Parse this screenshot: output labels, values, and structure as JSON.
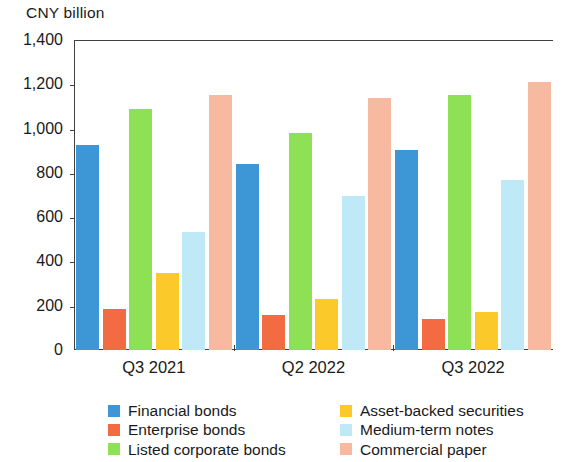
{
  "chart_data": {
    "type": "bar",
    "title": "CNY billion",
    "xlabel": "",
    "ylabel": "CNY billion",
    "ylim": [
      0,
      1400
    ],
    "ytick_step": 200,
    "grid": false,
    "legend_position": "bottom",
    "categories": [
      "Q3 2021",
      "Q2 2022",
      "Q3 2022"
    ],
    "ytick_labels": [
      "1,400",
      "1,200",
      "1,000",
      "800",
      "600",
      "400",
      "200",
      "0"
    ],
    "ytick_values": [
      1400,
      1200,
      1000,
      800,
      600,
      400,
      200,
      0
    ],
    "series": [
      {
        "name": "Financial bonds",
        "color": "#3d96d6",
        "values": [
          925,
          840,
          905
        ]
      },
      {
        "name": "Enterprise bonds",
        "color": "#f26b42",
        "values": [
          185,
          160,
          140
        ]
      },
      {
        "name": "Listed corporate bonds",
        "color": "#8ee055",
        "values": [
          1090,
          980,
          1150
        ]
      },
      {
        "name": "Asset-backed securities",
        "color": "#fcc92a",
        "values": [
          350,
          230,
          170
        ]
      },
      {
        "name": "Medium-term notes",
        "color": "#bfe9f7",
        "values": [
          535,
          695,
          770
        ]
      },
      {
        "name": "Commercial paper",
        "color": "#f7b9a0",
        "values": [
          1150,
          1140,
          1210
        ]
      }
    ]
  },
  "legend": {
    "columns": [
      {
        "items": [
          "Financial bonds",
          "Enterprise bonds",
          "Listed corporate bonds"
        ]
      },
      {
        "items": [
          "Asset-backed securities",
          "Medium-term notes",
          "Commercial paper"
        ]
      }
    ]
  }
}
